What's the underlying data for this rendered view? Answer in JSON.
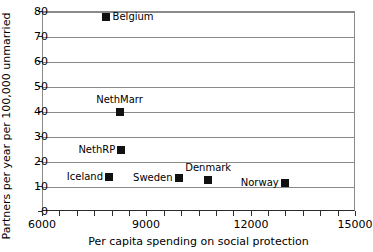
{
  "chart_data": {
    "type": "scatter",
    "title": "",
    "xlabel": "Per capita spending on social protection",
    "ylabel": "Partners per year per 100,000 unmarried",
    "xlim": [
      6000,
      15000
    ],
    "ylim": [
      0,
      80
    ],
    "xticks": [
      6000,
      6500,
      7000,
      7500,
      8000,
      8500,
      9000,
      9500,
      10000,
      10500,
      11000,
      11500,
      12000,
      12500,
      13000,
      13500,
      14000,
      14500,
      15000
    ],
    "xtick_labels": [
      {
        "value": 6000,
        "label": "6000"
      },
      {
        "value": 9000,
        "label": "9000"
      },
      {
        "value": 12000,
        "label": "12000"
      },
      {
        "value": 15000,
        "label": "15000"
      }
    ],
    "yticks": [
      0,
      10,
      20,
      30,
      40,
      50,
      60,
      70,
      80
    ],
    "ytick_labels": [
      "0",
      "10",
      "20",
      "30",
      "40",
      "50",
      "60",
      "70",
      "80"
    ],
    "grid": "horizontal",
    "legend": "none",
    "marker": "filled-square",
    "marker_color": "#111111",
    "points": [
      {
        "label": "Belgium",
        "x": 7800,
        "y": 78.0,
        "label_pos": "right-of"
      },
      {
        "label": "NethMarr",
        "x": 8200,
        "y": 40.0,
        "label_pos": "above"
      },
      {
        "label": "NethRP",
        "x": 8250,
        "y": 25.0,
        "label_pos": "left-of"
      },
      {
        "label": "Iceland",
        "x": 7900,
        "y": 14.0,
        "label_pos": "left-of"
      },
      {
        "label": "Sweden",
        "x": 9900,
        "y": 13.5,
        "label_pos": "left-of"
      },
      {
        "label": "Denmark",
        "x": 10750,
        "y": 13.0,
        "label_pos": "above"
      },
      {
        "label": "Norway",
        "x": 12950,
        "y": 11.5,
        "label_pos": "left-of"
      }
    ]
  }
}
